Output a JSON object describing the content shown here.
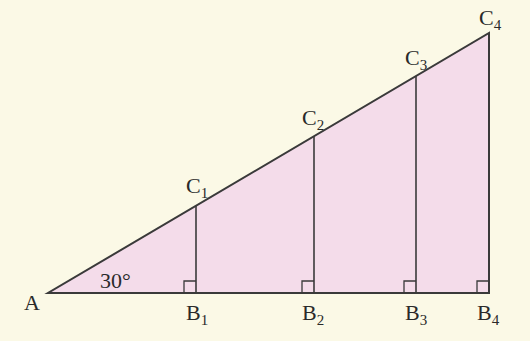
{
  "diagram": {
    "type": "geometry-triangle",
    "colors": {
      "background": "#fbf9e6",
      "fill": "#f4dcea",
      "stroke": "#3a3a3a"
    },
    "angle_label": "30°",
    "points": {
      "A": {
        "label": "A",
        "sub": ""
      },
      "B1": {
        "label": "B",
        "sub": "1"
      },
      "B2": {
        "label": "B",
        "sub": "2"
      },
      "B3": {
        "label": "B",
        "sub": "3"
      },
      "B4": {
        "label": "B",
        "sub": "4"
      },
      "C1": {
        "label": "C",
        "sub": "1"
      },
      "C2": {
        "label": "C",
        "sub": "2"
      },
      "C3": {
        "label": "C",
        "sub": "3"
      },
      "C4": {
        "label": "C",
        "sub": "4"
      }
    }
  }
}
